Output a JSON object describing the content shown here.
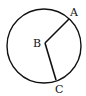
{
  "diagram": {
    "type": "circle-with-radii",
    "circle": {
      "cx": 44,
      "cy": 46,
      "r": 37
    },
    "center": {
      "name": "B",
      "x": 45,
      "y": 43
    },
    "points": [
      {
        "name": "A",
        "x": 69,
        "y": 19
      },
      {
        "name": "C",
        "x": 56,
        "y": 80
      }
    ],
    "segments": [
      {
        "from": "B",
        "to": "A"
      },
      {
        "from": "B",
        "to": "C"
      }
    ],
    "labels": {
      "A": "A",
      "B": "B",
      "C": "C"
    },
    "stroke_color": "#111111"
  }
}
